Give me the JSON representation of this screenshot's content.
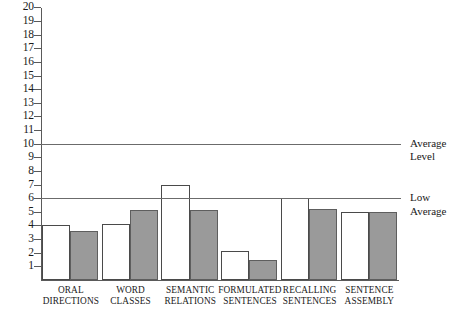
{
  "chart_data": {
    "type": "bar",
    "title": "",
    "subtitle": "",
    "xlabel": "",
    "ylabel": "",
    "ylim": [
      0,
      20
    ],
    "grid": false,
    "legend_position": "none",
    "categories": [
      "ORAL DIRECTIONS",
      "WORD CLASSES",
      "SEMANTIC RELATIONS",
      "FORMULATED SENTENCES",
      "RECALLING SENTENCES",
      "SENTENCE ASSEMBLY"
    ],
    "category_lines": [
      [
        "ORAL",
        "DIRECTIONS"
      ],
      [
        "WORD",
        "CLASSES"
      ],
      [
        "SEMANTIC",
        "RELATIONS"
      ],
      [
        "FORMULATED",
        "SENTENCES"
      ],
      [
        "RECALLING",
        "SENTENCES"
      ],
      [
        "SENTENCE",
        "ASSEMBLY"
      ]
    ],
    "series": [
      {
        "name": "white",
        "fill": "#ffffff",
        "values": [
          4.0,
          4.1,
          7.0,
          2.1,
          6.0,
          5.0
        ]
      },
      {
        "name": "gray",
        "fill": "#9a9a9a",
        "values": [
          3.6,
          5.1,
          5.1,
          1.5,
          5.2,
          5.0
        ]
      }
    ],
    "ytick_labels": [
      "1",
      "2",
      "3",
      "4",
      "5",
      "6",
      "7",
      "8",
      "9",
      "10",
      "11",
      "12",
      "13",
      "14",
      "15",
      "16",
      "17",
      "18",
      "19",
      "20"
    ],
    "ytick_values": [
      1,
      2,
      3,
      4,
      5,
      6,
      7,
      8,
      9,
      10,
      11,
      12,
      13,
      14,
      15,
      16,
      17,
      18,
      19,
      20
    ],
    "reference_lines": [
      {
        "value": 10,
        "label_lines": [
          "Average",
          "Level"
        ],
        "label": "Average Level"
      },
      {
        "value": 6,
        "label_lines": [
          "Low",
          "Average"
        ],
        "label": "Low Average"
      }
    ],
    "colors": {
      "bar_white_fill": "#ffffff",
      "bar_gray_fill": "#9a9a9a",
      "bar_outline": "#4a4a4a",
      "axis": "#5a5a5a",
      "reference_line": "#6b6b6b",
      "text": "#1a1a1a",
      "background": "#ffffff"
    }
  }
}
